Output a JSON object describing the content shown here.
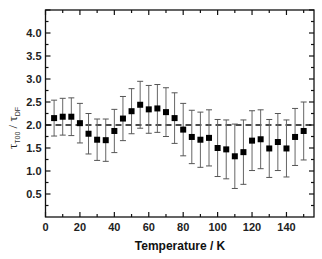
{
  "chart_data": {
    "type": "scatter",
    "title": "",
    "xlabel": "Temperature / K",
    "ylabel": "τ_T00 / τ_DF",
    "ylabel_parts": {
      "symbol1": "τ",
      "sub1": "T00",
      "sep": " / ",
      "symbol2": "τ",
      "sub2": "DF"
    },
    "xlim": [
      0,
      156
    ],
    "ylim": [
      0,
      4.5
    ],
    "x_ticks": [
      0,
      20,
      40,
      60,
      80,
      100,
      120,
      140
    ],
    "x_tick_labels": [
      "0",
      "20",
      "40",
      "60",
      "80",
      "100",
      "120",
      "140"
    ],
    "y_ticks": [
      0.5,
      1.0,
      1.5,
      2.0,
      2.5,
      3.0,
      3.5,
      4.0
    ],
    "y_tick_labels": [
      "0.5",
      "1.0",
      "1.5",
      "2.0",
      "2.5",
      "3.0",
      "3.5",
      "4.0"
    ],
    "grid": false,
    "legend": null,
    "reference_line": {
      "y": 2.0,
      "style": "dashed"
    },
    "series": [
      {
        "name": "ratio",
        "marker": "square",
        "x": [
          5,
          10,
          15,
          20,
          25,
          30,
          35,
          40,
          45,
          50,
          55,
          60,
          65,
          70,
          75,
          80,
          85,
          90,
          95,
          100,
          105,
          110,
          115,
          120,
          125,
          130,
          135,
          140,
          145,
          150
        ],
        "y": [
          2.15,
          2.18,
          2.18,
          2.04,
          1.81,
          1.68,
          1.67,
          1.87,
          2.14,
          2.3,
          2.44,
          2.34,
          2.36,
          2.28,
          2.15,
          1.9,
          1.74,
          1.68,
          1.72,
          1.5,
          1.47,
          1.32,
          1.41,
          1.66,
          1.69,
          1.49,
          1.63,
          1.49,
          1.74,
          1.87
        ],
        "yerr": [
          0.39,
          0.4,
          0.41,
          0.43,
          0.44,
          0.45,
          0.46,
          0.47,
          0.48,
          0.49,
          0.51,
          0.52,
          0.52,
          0.53,
          0.55,
          0.57,
          0.58,
          0.6,
          0.61,
          0.62,
          0.64,
          0.7,
          0.7,
          0.65,
          0.64,
          0.63,
          0.62,
          0.62,
          0.62,
          0.63
        ]
      }
    ]
  }
}
